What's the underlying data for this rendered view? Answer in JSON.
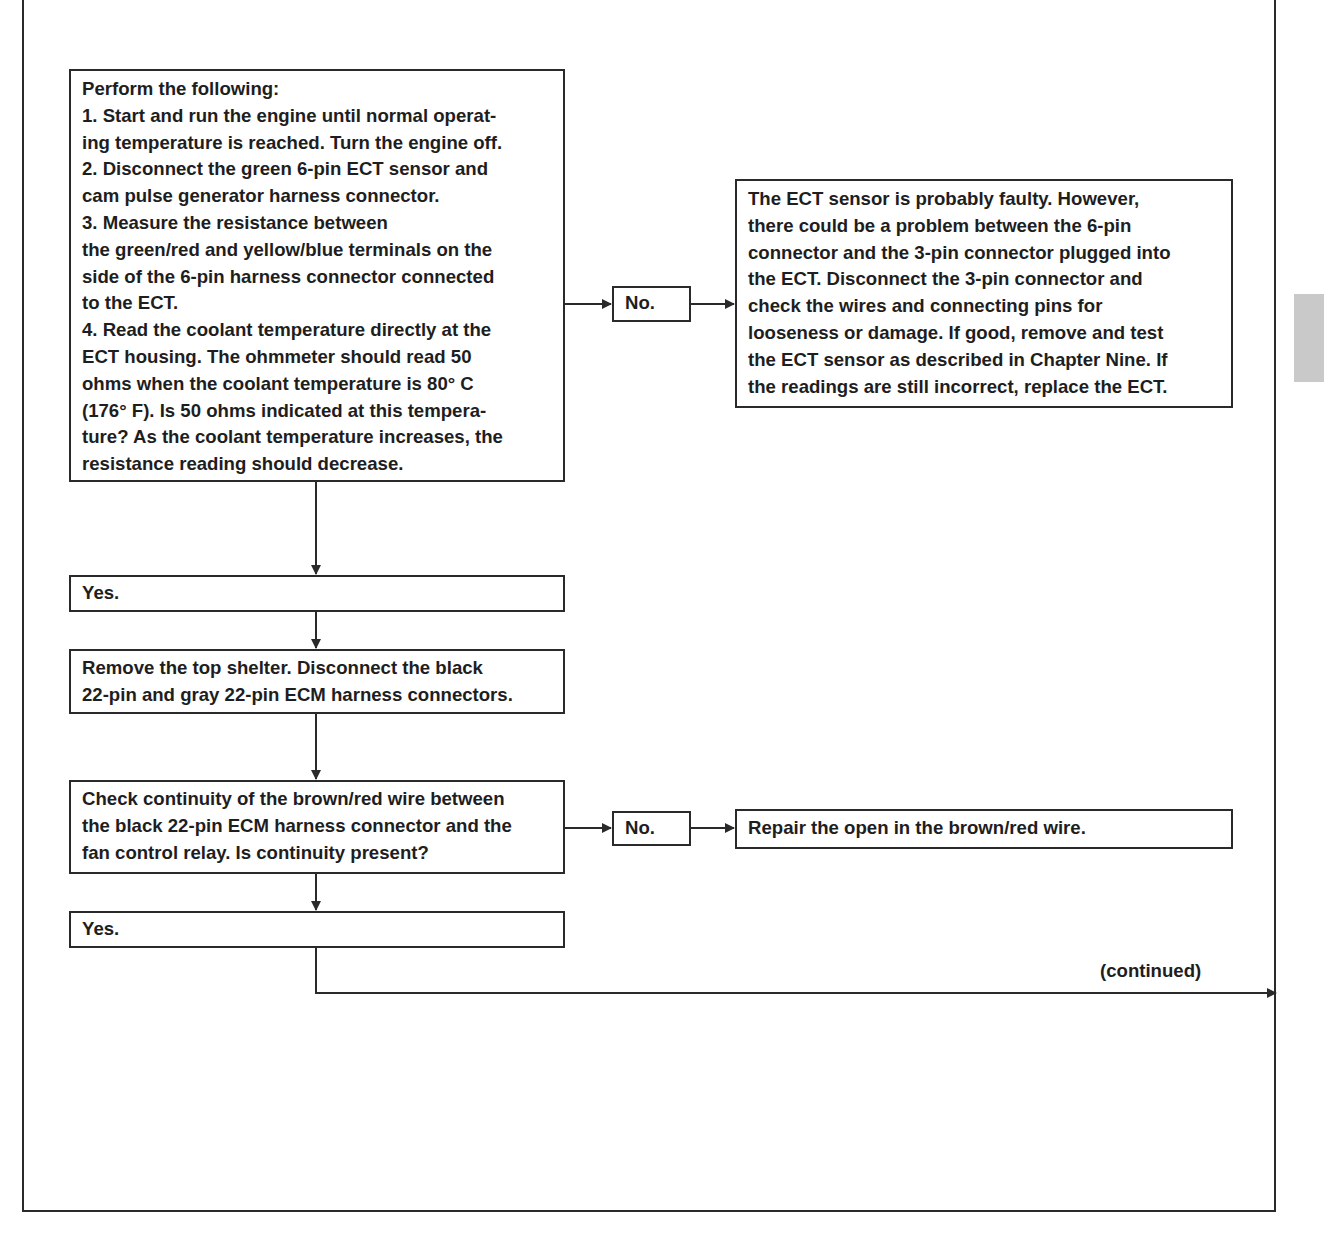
{
  "flowchart": {
    "step1": {
      "heading": "Perform the following:",
      "lines": [
        "1. Start and run the engine until normal operat-",
        "ing temperature is reached. Turn the engine off.",
        "2. Disconnect the green 6-pin ECT sensor and",
        "cam pulse generator harness connector.",
        "3.  Measure the resistance between",
        "the green/red and yellow/blue terminals on the",
        "side of the 6-pin  harness connector  connected",
        "to the ECT.",
        "4. Read the coolant temperature directly at the",
        "ECT housing. The ohmmeter should read 50",
        "ohms when the coolant temperature is 80°  C",
        "(176° F). Is 50 ohms indicated at this tempera-",
        "ture? As the coolant temperature increases, the",
        "resistance reading should decrease."
      ]
    },
    "step1_no": "No.",
    "step1_no_result": {
      "lines": [
        "The ECT sensor is probably faulty. However,",
        "there could be a problem between the 6-pin",
        "connector and the 3-pin connector  plugged into",
        "the ECT. Disconnect the 3-pin connector and",
        "check the wires and connecting pins for",
        "looseness or damage. If good, remove and test",
        "the ECT sensor  as described in Chapter Nine.  If",
        "the readings are still incorrect, replace the ECT."
      ]
    },
    "step1_yes": "Yes.",
    "step2": {
      "lines": [
        "Remove the top shelter. Disconnect the black",
        "22-pin and gray 22-pin ECM harness connectors."
      ]
    },
    "step3": {
      "lines": [
        "Check continuity of the brown/red wire between",
        "the black 22-pin ECM harness connector and the",
        "fan control relay. Is continuity present?"
      ]
    },
    "step3_no": "No.",
    "step3_no_result": "Repair the open in the brown/red wire.",
    "step3_yes": "Yes.",
    "continued_label": "(continued)"
  },
  "colors": {
    "line": "#2a2a2a",
    "text": "#1e1e1e",
    "tab": "#c9c9c9"
  }
}
